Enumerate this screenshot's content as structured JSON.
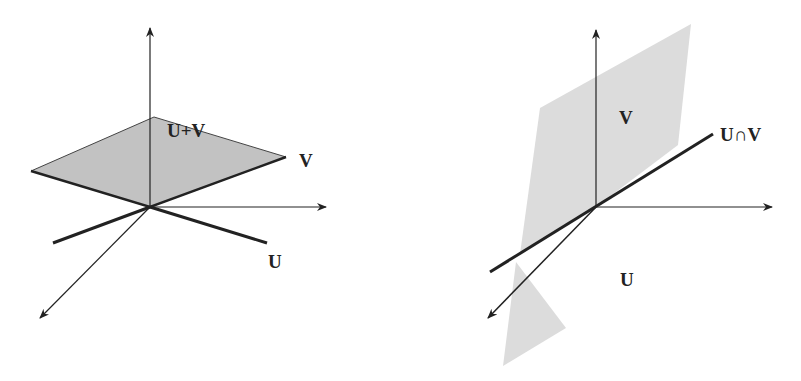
{
  "left_diagram": {
    "title": "Sum of subspaces",
    "labels": {
      "sum": "U+V",
      "v": "V",
      "u": "U"
    },
    "plane_color": "#c2c2c2",
    "line_color": "#222222"
  },
  "right_diagram": {
    "title": "Intersection of subspaces",
    "labels": {
      "v": "V",
      "intersection": "U∩V",
      "u": "U"
    },
    "plane_color": "#dcdcdc",
    "line_color": "#222222"
  }
}
